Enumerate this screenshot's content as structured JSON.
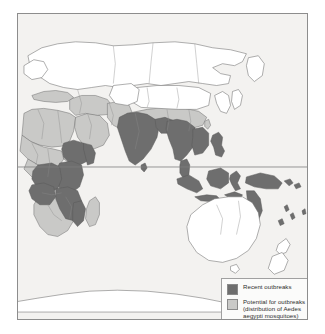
{
  "figure": {
    "type": "thematic-world-map",
    "projection": "eastern-hemisphere",
    "background_color": "#ffffff",
    "map_background_color": "#f3f2f0",
    "frame_color": "#8d8d8d"
  },
  "map": {
    "equator_line_label": "equator",
    "land_outline_color": "#6d6d6d",
    "unshaded_land_color": "#ffffff",
    "ocean_color": "#f3f2f0",
    "regions_recent_outbreaks": [
      "India",
      "Bangladesh",
      "Myanmar",
      "Thailand",
      "Cambodia",
      "Laos",
      "Vietnam",
      "Malaysia",
      "Indonesia",
      "Philippines",
      "Sri Lanka",
      "Papua New Guinea",
      "Queensland coast (Australia)",
      "Solomon Islands",
      "Vanuatu",
      "Fiji",
      "Ethiopia",
      "Somalia",
      "Kenya",
      "Tanzania",
      "Uganda",
      "Democratic Republic of the Congo",
      "Angola",
      "Mozambique",
      "Zambia"
    ],
    "regions_potential_outbreaks": [
      "North Africa",
      "West Africa",
      "Southern Africa",
      "Madagascar",
      "Arabian Peninsula",
      "Middle East",
      "Mediterranean coast",
      "Pakistan",
      "Southern China",
      "Taiwan"
    ]
  },
  "legend": {
    "items": [
      {
        "label": "Recent outbreaks",
        "color": "#6e6e6e",
        "swatch_name": "recent-outbreaks-swatch"
      },
      {
        "label": "Potential for outbreaks\n(distribution of Aedes\naegypti mosquitoes)",
        "color": "#c9c9c7",
        "swatch_name": "potential-outbreaks-swatch"
      }
    ]
  },
  "colors": {
    "dark_shading": "#6e6e6e",
    "light_shading": "#c9c9c7",
    "outline": "#6d6d6d",
    "legend_border": "#a0a0a0"
  }
}
